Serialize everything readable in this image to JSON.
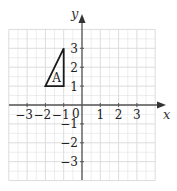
{
  "diagram": {
    "type": "coordinate-grid",
    "x_axis_label": "x",
    "y_axis_label": "y",
    "origin_label": "0",
    "x_ticks": [
      {
        "value": -3,
        "label": "−3"
      },
      {
        "value": -2,
        "label": "−2"
      },
      {
        "value": -1,
        "label": "−1"
      },
      {
        "value": 1,
        "label": "1"
      },
      {
        "value": 2,
        "label": "2"
      },
      {
        "value": 3,
        "label": "3"
      }
    ],
    "y_ticks": [
      {
        "value": 3,
        "label": "3"
      },
      {
        "value": 2,
        "label": "2"
      },
      {
        "value": 1,
        "label": "1"
      },
      {
        "value": -1,
        "label": "−1"
      },
      {
        "value": -2,
        "label": "−2"
      },
      {
        "value": -3,
        "label": "−3"
      }
    ],
    "grid_range": {
      "x": [
        -4,
        4
      ],
      "y": [
        -4,
        4
      ]
    },
    "shapes": [
      {
        "name": "triangle-A",
        "label": "A",
        "vertices": [
          [
            -2,
            1
          ],
          [
            -1,
            1
          ],
          [
            -1,
            3
          ]
        ]
      }
    ],
    "colors": {
      "grid": "#dcdcdc",
      "axis": "#555555",
      "shape": "#1a1a1a",
      "text": "#222222"
    }
  }
}
